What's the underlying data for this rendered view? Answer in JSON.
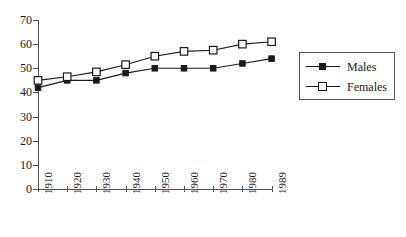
{
  "chart_data": {
    "type": "line",
    "title": "",
    "subtitle": "",
    "xlabel": "",
    "ylabel": "",
    "categories": [
      "1910",
      "1920",
      "1930",
      "1940",
      "1950",
      "1960",
      "1970",
      "1980",
      "1989"
    ],
    "series": [
      {
        "name": "Males",
        "marker": "filled-square",
        "values": [
          42,
          45,
          45,
          48,
          50,
          50,
          50,
          52,
          54
        ]
      },
      {
        "name": "Females",
        "marker": "open-square",
        "values": [
          45,
          46.5,
          48.5,
          51.5,
          55,
          57,
          57.5,
          60,
          61
        ]
      }
    ],
    "ylim": [
      0,
      70
    ],
    "ytick_labels": [
      "0",
      "10",
      "20",
      "30",
      "40",
      "50",
      "60",
      "70"
    ],
    "ytick_values": [
      0,
      10,
      20,
      30,
      40,
      50,
      60,
      70
    ],
    "grid": false,
    "legend_position": "right",
    "xtick_rotation": -90,
    "colors": {
      "line": "#1a1a1a",
      "axis": "#555555",
      "background": "#ffffff"
    }
  },
  "legend": {
    "items": [
      {
        "label": "Males",
        "marker": "filled-square"
      },
      {
        "label": "Females",
        "marker": "open-square"
      }
    ]
  }
}
